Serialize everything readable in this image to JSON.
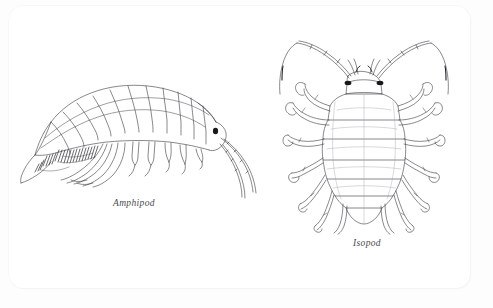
{
  "page": {
    "background_color": "#fdfdfd",
    "card_color": "#ffffff",
    "ink_color": "#3a3a3f",
    "eye_color": "#15151a"
  },
  "figures": [
    {
      "id": "amphipod",
      "caption": "Amphipod",
      "view": "lateral",
      "orientation": "head facing right, body arched dorsally",
      "body_segments": 13,
      "leg_pairs": 7,
      "antennae": 2,
      "eyes": 1,
      "eye_color": "#15151a",
      "features": [
        "arched segmented pereon and pleon",
        "dense setae fringe on pleopods",
        "two long trailing antennae",
        "pointed uropods at posterior"
      ]
    },
    {
      "id": "isopod",
      "caption": "Isopod",
      "view": "dorsal",
      "orientation": "head at top, telson at bottom",
      "body_segments": 8,
      "leg_pairs": 7,
      "antennae": 2,
      "eyes": 2,
      "eye_color": "#15151a",
      "features": [
        "flattened oval segmented body",
        "bilaterally symmetric jointed legs",
        "two long curved sweeping antennae",
        "rounded terminal telson"
      ]
    }
  ]
}
